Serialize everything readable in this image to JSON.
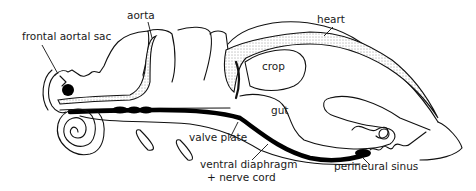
{
  "figure": {
    "background": "#ffffff",
    "ink": "#111111"
  },
  "labels": {
    "frontal_aortal_sac": "frontal aortal sac",
    "aorta": "aorta",
    "heart": "heart",
    "crop": "crop",
    "gut": "gut",
    "valve_plate": "valve plate",
    "ventral_diaphragm_line1": "ventral diaphragm",
    "ventral_diaphragm_line2": "+ nerve cord",
    "perineural_sinus": "perineural sinus"
  }
}
